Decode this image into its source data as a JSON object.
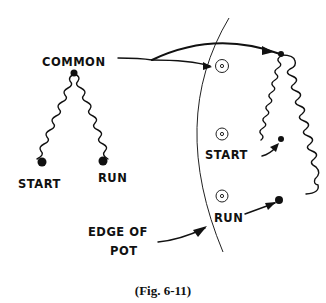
{
  "labels": {
    "common": "COMMON",
    "left_start": "START",
    "left_run": "RUN",
    "right_start": "START",
    "right_run": "RUN",
    "edge_line1": "EDGE OF",
    "edge_line2": "POT"
  },
  "caption": "(Fig. 6-11)"
}
